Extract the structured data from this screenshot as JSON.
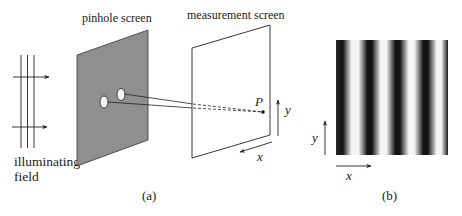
{
  "figure": {
    "panel_a": {
      "caption": "(a)",
      "illuminating_field_label_line1": "illuminating",
      "illuminating_field_label_line2": "field",
      "pinhole_screen_label": "pinhole screen",
      "measurement_screen_label": "measurement screen",
      "point_label": "P",
      "x_axis_label": "x",
      "y_axis_label": "y"
    },
    "panel_b": {
      "caption": "(b)",
      "x_axis_label": "x",
      "y_axis_label": "y",
      "fringe_count_dark": 5
    }
  },
  "colors": {
    "pinhole_screen_fill": "#8f8f8f",
    "line": "#222222",
    "fringe_dark": "#111111",
    "fringe_light": "#f2f2f2"
  }
}
